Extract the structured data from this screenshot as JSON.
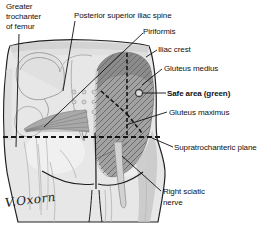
{
  "diagram": {
    "labels": {
      "greater_trochanter": "Greater\ntrochanter\nof femur",
      "posterior_superior_iliac_spine": "Posterior superior iliac spine",
      "piriformis": "Piriformis",
      "iliac_crest": "Iliac crest",
      "gluteus_medius": "Gluteus medius",
      "safe_area": "Safe area (green)",
      "gluteus_maximus": "Gluteus maximus",
      "supratrochanteric_plane": "Supratrochanteric plane",
      "right_sciatic_nerve": "Right sciatic\nnerve"
    },
    "signature": "V.Oxorn",
    "markers": {
      "safe_area_marker": "small-circle"
    },
    "colors": {
      "background": "#ffffff",
      "label_text": "#111111",
      "leader_line": "#111111",
      "dashed_line": "#151515",
      "muscle_dark": "#8b8b8b",
      "muscle_mid": "#a2a2a2",
      "skin_light": "#e7e7e7",
      "safe_marker_fill": "#dedede"
    }
  }
}
